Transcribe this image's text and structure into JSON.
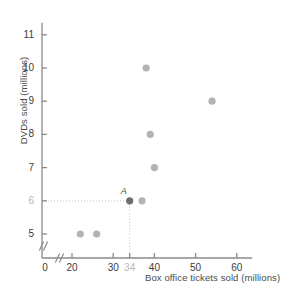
{
  "chart_data": {
    "type": "scatter",
    "title": "",
    "xlabel": "Box office tickets sold (millions)",
    "ylabel": "DVDs sold (millions)",
    "xlim": [
      0,
      63
    ],
    "ylim": [
      4.4,
      11.6
    ],
    "x_axis_break": true,
    "y_axis_break": true,
    "grid": false,
    "legend": null,
    "xticks": [
      {
        "value": 0,
        "label": "0",
        "highlight": false
      },
      {
        "value": 20,
        "label": "20",
        "highlight": false
      },
      {
        "value": 30,
        "label": "30",
        "highlight": false
      },
      {
        "value": 34,
        "label": "34",
        "highlight": true
      },
      {
        "value": 40,
        "label": "40",
        "highlight": false
      },
      {
        "value": 50,
        "label": "50",
        "highlight": false
      },
      {
        "value": 60,
        "label": "60",
        "highlight": false
      }
    ],
    "yticks": [
      {
        "value": 5,
        "label": "5",
        "highlight": false
      },
      {
        "value": 6,
        "label": "6",
        "highlight": true
      },
      {
        "value": 7,
        "label": "7",
        "highlight": false
      },
      {
        "value": 8,
        "label": "8",
        "highlight": false
      },
      {
        "value": 9,
        "label": "9",
        "highlight": false
      },
      {
        "value": 10,
        "label": "10",
        "highlight": false
      },
      {
        "value": 11,
        "label": "11",
        "highlight": false
      }
    ],
    "points": [
      {
        "x": 22,
        "y": 5,
        "label": "",
        "highlight": false
      },
      {
        "x": 26,
        "y": 5,
        "label": "",
        "highlight": false
      },
      {
        "x": 34,
        "y": 6,
        "label": "A",
        "highlight": true
      },
      {
        "x": 37,
        "y": 6,
        "label": "",
        "highlight": false
      },
      {
        "x": 38,
        "y": 10,
        "label": "",
        "highlight": false
      },
      {
        "x": 39,
        "y": 8,
        "label": "",
        "highlight": false
      },
      {
        "x": 40,
        "y": 7,
        "label": "",
        "highlight": false
      },
      {
        "x": 54,
        "y": 9,
        "label": "",
        "highlight": false
      }
    ],
    "guide_lines": [
      {
        "type": "horizontal",
        "from": {
          "x": 0,
          "y": 6
        },
        "to": {
          "x": 34,
          "y": 6
        },
        "style": "dotted"
      },
      {
        "type": "vertical",
        "from": {
          "x": 34,
          "y": 6
        },
        "to": {
          "x": 34,
          "y": 4.4
        },
        "style": "dotted"
      }
    ],
    "colors": {
      "point": "#b3b3b3",
      "point_highlight": "#6e6e6e",
      "axis": "#8a8a8a",
      "guide": "#c9c9c9",
      "tick_label": "#3c3c3c",
      "tick_label_highlight": "#b8b8b8",
      "axis_label": "#4a4a4a",
      "background": "#ffffff"
    }
  }
}
